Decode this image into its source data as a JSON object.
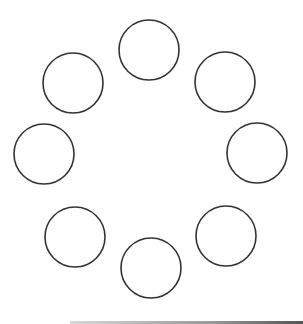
{
  "diagram": {
    "type": "ring-of-circles",
    "stroke_color": "#333333",
    "fill_color": "#ffffff",
    "radius": 30,
    "circles": [
      {
        "name": "top",
        "cx": 149,
        "cy": 50
      },
      {
        "name": "upper-right",
        "cx": 225,
        "cy": 82
      },
      {
        "name": "right",
        "cx": 257,
        "cy": 153
      },
      {
        "name": "lower-right",
        "cx": 226,
        "cy": 236
      },
      {
        "name": "bottom",
        "cx": 151,
        "cy": 268
      },
      {
        "name": "lower-left",
        "cx": 75,
        "cy": 237
      },
      {
        "name": "left",
        "cx": 44,
        "cy": 154
      },
      {
        "name": "upper-left",
        "cx": 73,
        "cy": 83
      }
    ]
  }
}
